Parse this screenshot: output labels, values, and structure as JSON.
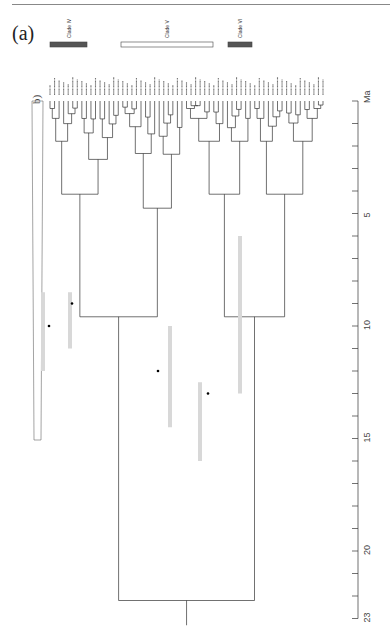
{
  "figure": {
    "panel_a_label": "(a)",
    "panel_b_label": "b)",
    "axis": {
      "unit_label": "Ma",
      "ticks": [
        0,
        1,
        2,
        3,
        4,
        5,
        6,
        7,
        8,
        9,
        10,
        11,
        12,
        13,
        14,
        15,
        16,
        17,
        18,
        19,
        20,
        21,
        22,
        23
      ],
      "labeled_ticks": [
        "5",
        "10",
        "15",
        "20",
        "23"
      ],
      "max": 23
    },
    "clades": [
      {
        "name": "Clade IV",
        "x1": 50,
        "x2": 87,
        "fill": "#555555"
      },
      {
        "name": "Clade V",
        "x1": 121,
        "x2": 213,
        "fill": "#ffffff"
      },
      {
        "name": "Clade VI",
        "x1": 228,
        "x2": 252,
        "fill": "#555555"
      }
    ],
    "tip_count": 61,
    "colors": {
      "branch": "#333333",
      "hpd_bar": "#d8d8d8",
      "node": "#000000"
    }
  },
  "chart_data": {
    "type": "phylogenetic-tree",
    "title": "(a)",
    "xlabel": "Ma",
    "time_axis_range": [
      0,
      23
    ],
    "clade_labels": [
      "Clade IV",
      "Clade V",
      "Clade VI"
    ],
    "subpanel": "b)",
    "tips": 61,
    "root_age_ma": 23
  }
}
